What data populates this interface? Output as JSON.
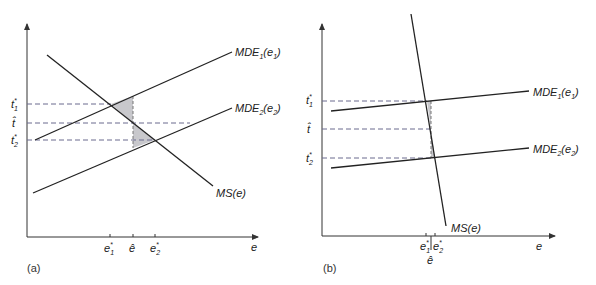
{
  "panels": [
    {
      "id": "a",
      "label": "(a)",
      "x_axis_label": "e",
      "y_ticks": [
        {
          "name": "t1-star",
          "base": "t",
          "sub": "1",
          "sup": "*",
          "y": 104
        },
        {
          "name": "t-hat",
          "base": "t̂",
          "sub": "",
          "sup": "",
          "y": 123
        },
        {
          "name": "t2-star",
          "base": "t",
          "sub": "2",
          "sup": "*",
          "y": 140
        }
      ],
      "x_ticks": [
        {
          "name": "e1-star",
          "base": "e",
          "sub": "1",
          "sup": "*",
          "x": 110
        },
        {
          "name": "e-hat",
          "base": "ê",
          "sub": "",
          "sup": "",
          "x": 133
        },
        {
          "name": "e2-star",
          "base": "e",
          "sub": "2",
          "sup": "*",
          "x": 155
        }
      ],
      "curves": {
        "mde1": {
          "label": "MDE",
          "sub": "1",
          "arg": "(e",
          "argsub": "1",
          "close": ")"
        },
        "mde2": {
          "label": "MDE",
          "sub": "2",
          "arg": "(e",
          "argsub": "2",
          "close": ")"
        },
        "ms": {
          "label": "MS(e)"
        }
      }
    },
    {
      "id": "b",
      "label": "(b)",
      "x_axis_label": "e",
      "y_ticks": [
        {
          "name": "t1-star",
          "base": "t",
          "sub": "1",
          "sup": "*",
          "y": 101
        },
        {
          "name": "t-hat",
          "base": "t̂",
          "sub": "",
          "sup": "",
          "y": 129
        },
        {
          "name": "t2-star",
          "base": "t",
          "sub": "2",
          "sup": "*",
          "y": 158
        }
      ],
      "x_ticks": [
        {
          "name": "e1-star",
          "base": "e",
          "sub": "1",
          "sup": "*",
          "x": 426
        },
        {
          "name": "e-hat",
          "base": "ê",
          "sub": "",
          "sup": "",
          "x": 431
        },
        {
          "name": "e2-star",
          "base": "e",
          "sub": "2",
          "sup": "*",
          "x": 435
        }
      ],
      "curves": {
        "mde1": {
          "label": "MDE",
          "sub": "1",
          "arg": "(e",
          "argsub": "1",
          "close": ")"
        },
        "mde2": {
          "label": "MDE",
          "sub": "2",
          "arg": "(e",
          "argsub": "2",
          "close": ")"
        },
        "ms": {
          "label": "MS(e)"
        }
      }
    }
  ],
  "colors": {
    "line": "#222222",
    "dash": "#666688",
    "shade": "#c8c8cc"
  }
}
